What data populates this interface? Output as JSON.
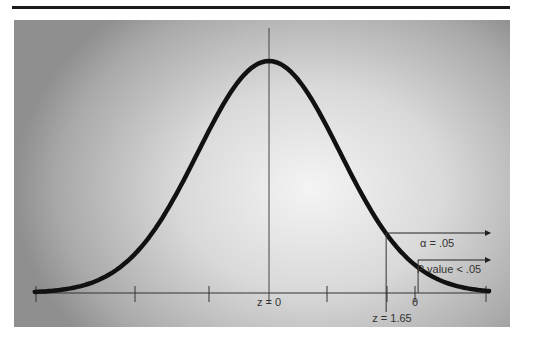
{
  "diagram": {
    "type": "normal-distribution-one-tailed-test",
    "center_label": "z = 0",
    "critical_label": "z = 1.65",
    "theta_label": "θ",
    "alpha_label": "α = .05",
    "pvalue_label": "P value < .05",
    "critical_z": 1.65,
    "theta_z": 2.1
  }
}
